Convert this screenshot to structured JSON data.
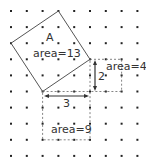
{
  "grid": {
    "cols": 9,
    "rows": 10,
    "origin_x": 11,
    "origin_y": 11,
    "spacing_x": 15.8,
    "spacing_y": 16.1,
    "dot_color": "#222222"
  },
  "square_a": {
    "label": "A",
    "area_label": "area=13",
    "vertices": [
      [
        3,
        0
      ],
      [
        5,
        3
      ],
      [
        2,
        5
      ],
      [
        0,
        2
      ]
    ]
  },
  "square_4": {
    "area_label": "area=4",
    "from": [
      5,
      3
    ],
    "to": [
      7,
      5
    ]
  },
  "square_9": {
    "area_label": "area=9",
    "from": [
      2,
      5
    ],
    "to": [
      5,
      8
    ]
  },
  "measure_vertical": {
    "label": "2"
  },
  "measure_horizontal": {
    "label": "3"
  }
}
